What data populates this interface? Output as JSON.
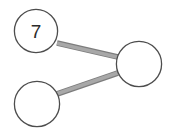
{
  "diagram": {
    "type": "node-link-graph",
    "background_color": "#ffffff",
    "width": 171,
    "height": 138,
    "node_fill_color": "#ffffff",
    "node_stroke_color": "#4d4d4d",
    "node_stroke_width": 1.2,
    "label_color": "#2b2b2b",
    "edge_color": "#a6a6a6",
    "edge_shade_color": "#7d7d7d",
    "edge_width": 5,
    "nodes": [
      {
        "id": "node-top-left",
        "label": "7",
        "cx": 36,
        "cy": 31,
        "r": 22,
        "has_label": true
      },
      {
        "id": "node-bottom-left",
        "label": "",
        "cx": 37,
        "cy": 104,
        "r": 23,
        "has_label": false
      },
      {
        "id": "node-right",
        "label": "",
        "cx": 139,
        "cy": 64,
        "r": 23,
        "has_label": false
      }
    ],
    "edges": [
      {
        "id": "edge-top-left-to-right",
        "from": "node-top-left",
        "to": "node-right",
        "x1": 57,
        "y1": 43,
        "x2": 118,
        "y2": 57
      },
      {
        "id": "edge-bottom-left-to-right",
        "from": "node-bottom-left",
        "to": "node-right",
        "x1": 57,
        "y1": 94,
        "x2": 118,
        "y2": 73
      }
    ]
  }
}
